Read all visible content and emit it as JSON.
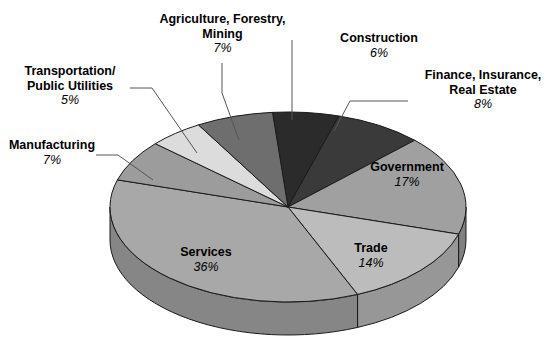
{
  "chart_data": {
    "type": "pie",
    "title": "",
    "subtitle": "",
    "xlabel": "",
    "ylabel": "",
    "legend_position": "none",
    "grid": false,
    "style": "3d-exploded-none",
    "categories": [
      "Construction",
      "Finance, Insurance, Real Estate",
      "Government",
      "Trade",
      "Services",
      "Manufacturing",
      "Transportation/Public Utilities",
      "Agriculture, Forestry, Mining"
    ],
    "values": [
      6,
      8,
      17,
      14,
      36,
      7,
      5,
      7
    ],
    "value_labels": [
      "6%",
      "8%",
      "17%",
      "14%",
      "36%",
      "7%",
      "5%",
      "7%"
    ],
    "units": "percent",
    "total": 100,
    "slices": [
      {
        "name": "Construction",
        "value": 6,
        "label": "6%",
        "color": "#2b2b2b",
        "side_color": "#1d1d1d",
        "label_mode": "callout"
      },
      {
        "name": "Finance, Insurance, Real Estate",
        "value": 8,
        "label": "8%",
        "color": "#3a3a3a",
        "side_color": "#272727",
        "label_mode": "callout"
      },
      {
        "name": "Government",
        "value": 17,
        "label": "17%",
        "color": "#a0a0a0",
        "side_color": "#808080",
        "label_mode": "inner"
      },
      {
        "name": "Trade",
        "value": 14,
        "label": "14%",
        "color": "#bcbcbc",
        "side_color": "#979797",
        "label_mode": "inner"
      },
      {
        "name": "Services",
        "value": 36,
        "label": "36%",
        "color": "#a8a8a8",
        "side_color": "#868686",
        "label_mode": "inner"
      },
      {
        "name": "Manufacturing",
        "value": 7,
        "label": "7%",
        "color": "#9c9c9c",
        "side_color": "#7d7d7d",
        "label_mode": "callout"
      },
      {
        "name": "Transportation/Public Utilities",
        "value": 5,
        "label": "5%",
        "color": "#dcdcdc",
        "side_color": "#b0b0b0",
        "label_mode": "callout"
      },
      {
        "name": "Agriculture, Forestry, Mining",
        "value": 7,
        "label": "7%",
        "color": "#6e6e6e",
        "side_color": "#575757",
        "label_mode": "callout"
      }
    ]
  },
  "callouts": {
    "agriculture": {
      "line1": "Agriculture, Forestry,",
      "line2": "Mining",
      "pct": "7%"
    },
    "construction": {
      "line1": "Construction",
      "line2": "",
      "pct": "6%"
    },
    "finance": {
      "line1": "Finance, Insurance,",
      "line2": "Real Estate",
      "pct": "8%"
    },
    "transportation": {
      "line1": "Transportation/",
      "line2": "Public Utilities",
      "pct": "5%"
    },
    "manufacturing": {
      "line1": "Manufacturing",
      "line2": "",
      "pct": "7%"
    }
  },
  "inner_labels": {
    "government": {
      "name": "Government",
      "pct": "17%"
    },
    "trade": {
      "name": "Trade",
      "pct": "14%"
    },
    "services": {
      "name": "Services",
      "pct": "36%"
    }
  },
  "colors": {
    "background": "#ffffff",
    "text": "#000000",
    "leader_line": "#555555",
    "slice_outline": "#1a1a1a"
  }
}
